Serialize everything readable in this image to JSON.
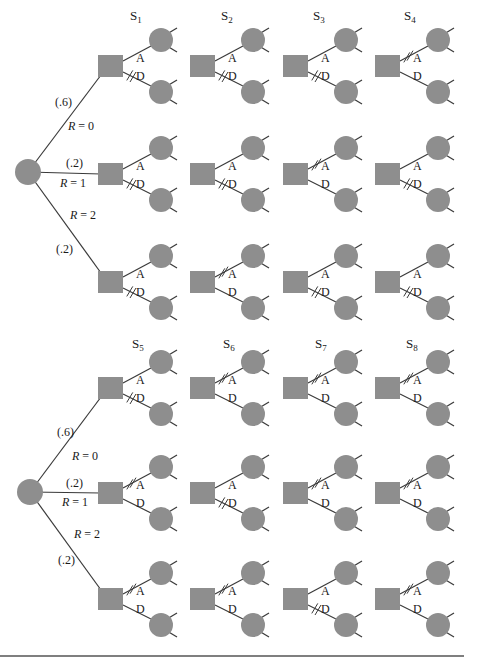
{
  "colors": {
    "node_fill": "#8e8e8e",
    "line": "#3a3a3a",
    "text": "#1a1a1a",
    "rule": "#555555"
  },
  "trees": [
    {
      "id": "top",
      "root": {
        "cx": 28,
        "cy": 172,
        "r": 13
      },
      "branches": [
        {
          "prob": "(.6)",
          "label": "R = 0",
          "prob_xy": [
            55,
            106
          ],
          "label_xy": [
            68,
            130
          ]
        },
        {
          "prob": "(.2)",
          "label": "R = 1",
          "prob_xy": [
            66,
            167
          ],
          "label_xy": [
            60,
            187
          ]
        },
        {
          "prob": "(.2)",
          "label": "R = 2",
          "prob_xy": [
            56,
            253
          ],
          "label_xy": [
            70,
            219
          ]
        }
      ],
      "strategies": [
        {
          "name": "S",
          "sub": "1",
          "x": 130,
          "y": 20
        },
        {
          "name": "S",
          "sub": "2",
          "x": 221,
          "y": 20
        },
        {
          "name": "S",
          "sub": "3",
          "x": 313,
          "y": 20
        },
        {
          "name": "S",
          "sub": "4",
          "x": 404,
          "y": 20
        }
      ],
      "rows_y": [
        66,
        174,
        282
      ],
      "blocked": [
        [
          "D",
          "D",
          "D",
          "A"
        ],
        [
          "D",
          "D",
          "A",
          "D"
        ],
        [
          "D",
          "A",
          "D",
          "D"
        ]
      ]
    },
    {
      "id": "bottom",
      "root": {
        "cx": 30,
        "cy": 492,
        "r": 13
      },
      "branches": [
        {
          "prob": "(.6)",
          "label": "R = 0",
          "prob_xy": [
            57,
            436
          ],
          "label_xy": [
            72,
            460
          ]
        },
        {
          "prob": "(.2)",
          "label": "R = 1",
          "prob_xy": [
            66,
            487
          ],
          "label_xy": [
            62,
            506
          ]
        },
        {
          "prob": "(.2)",
          "label": "R = 2",
          "prob_xy": [
            58,
            564
          ],
          "label_xy": [
            74,
            538
          ]
        }
      ],
      "strategies": [
        {
          "name": "S",
          "sub": "5",
          "x": 132,
          "y": 348
        },
        {
          "name": "S",
          "sub": "6",
          "x": 223,
          "y": 348
        },
        {
          "name": "S",
          "sub": "7",
          "x": 315,
          "y": 348
        },
        {
          "name": "S",
          "sub": "8",
          "x": 406,
          "y": 348
        }
      ],
      "rows_y": [
        388,
        493,
        599
      ],
      "blocked": [
        [
          "D",
          "A",
          "A",
          "A"
        ],
        [
          "A",
          "D",
          "A",
          "A"
        ],
        [
          "A",
          "A",
          "D",
          "A"
        ]
      ]
    }
  ],
  "columns_x": [
    98,
    190,
    283,
    375
  ],
  "branch_labels": {
    "accept": "A",
    "decline": "D"
  },
  "legend_icons": {
    "chance_node": "circle-icon",
    "decision_node": "square-icon",
    "blocked_branch": "double-slash-icon"
  }
}
